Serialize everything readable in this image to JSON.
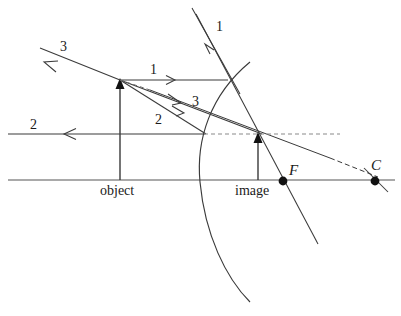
{
  "figure": {
    "kind": "optics-ray-diagram",
    "stroke_color": "#3a3a3a",
    "axis_color": "#555555",
    "dash_color": "#6b6b6b",
    "point_color": "#111111",
    "background": "#ffffff"
  },
  "labels": {
    "ray_1_incident": "1",
    "ray_1_reflected": "1",
    "ray_2_incident": "2",
    "ray_2_reflected": "2",
    "ray_3_incident": "3",
    "ray_3_reflected": "3",
    "object": "object",
    "image": "image",
    "focal_point": "F",
    "center_of_curvature": "C"
  },
  "geometry": {
    "optical_axis_y": 180,
    "object_x": 120,
    "object_tip_y": 80,
    "image_x": 258,
    "image_tip_y": 134,
    "mirror_vertex_x": 200,
    "focal_point_x": 283,
    "center_x": 375,
    "dashed_line_y": 134,
    "ray2_line_y": 134
  }
}
